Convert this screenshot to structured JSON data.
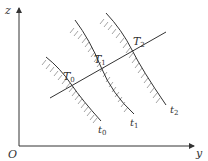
{
  "diagram": {
    "axes": {
      "vertical_label": "z",
      "horizontal_label": "y",
      "origin_label": "O"
    },
    "ray_points": [
      {
        "label": "T",
        "sub": "0"
      },
      {
        "label": "T",
        "sub": "1"
      },
      {
        "label": "T",
        "sub": "2"
      }
    ],
    "curves": [
      {
        "label": "t",
        "sub": "0"
      },
      {
        "label": "t",
        "sub": "1"
      },
      {
        "label": "t",
        "sub": "2"
      }
    ],
    "colors": {
      "line": "#333333",
      "hatch": "#9a9a9a"
    }
  }
}
